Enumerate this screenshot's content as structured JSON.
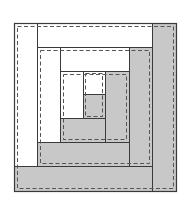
{
  "diagram": {
    "colors": {
      "background": "#ffffff",
      "light_fabric": "#ffffff",
      "dark_fabric": "#c8c8c8",
      "outline": "#3a3a3a",
      "seam": "#555555"
    },
    "block": {
      "x": 14,
      "y": 23,
      "w": 162,
      "h": 168
    },
    "strips": [
      {
        "id": "round1-left",
        "tone": "light",
        "x": 14,
        "y": 23,
        "w": 23,
        "h": 143
      },
      {
        "id": "round1-top",
        "tone": "light",
        "x": 37,
        "y": 23,
        "w": 115,
        "h": 24
      },
      {
        "id": "round1-right",
        "tone": "dark",
        "x": 152,
        "y": 23,
        "w": 24,
        "h": 168
      },
      {
        "id": "round1-bottom",
        "tone": "dark",
        "x": 14,
        "y": 166,
        "w": 138,
        "h": 25
      },
      {
        "id": "round2-left",
        "tone": "light",
        "x": 37,
        "y": 47,
        "w": 23,
        "h": 95
      },
      {
        "id": "round2-top",
        "tone": "light",
        "x": 60,
        "y": 47,
        "w": 69,
        "h": 24
      },
      {
        "id": "round2-right",
        "tone": "dark",
        "x": 129,
        "y": 47,
        "w": 23,
        "h": 119
      },
      {
        "id": "round2-bottom",
        "tone": "dark",
        "x": 37,
        "y": 142,
        "w": 92,
        "h": 24
      },
      {
        "id": "round3-left",
        "tone": "light",
        "x": 60,
        "y": 71,
        "w": 23,
        "h": 47
      },
      {
        "id": "round3-top",
        "tone": "light",
        "x": 83,
        "y": 71,
        "w": 22,
        "h": 23
      },
      {
        "id": "round3-right",
        "tone": "dark",
        "x": 105,
        "y": 71,
        "w": 24,
        "h": 71
      },
      {
        "id": "round3-bottom",
        "tone": "dark",
        "x": 60,
        "y": 118,
        "w": 45,
        "h": 24
      },
      {
        "id": "center",
        "tone": "dark",
        "x": 83,
        "y": 94,
        "w": 22,
        "h": 24
      }
    ],
    "seams": [
      {
        "id": "seam-round1",
        "x": 17,
        "y": 26,
        "w": 156,
        "h": 162
      },
      {
        "id": "seam-round2",
        "x": 40,
        "y": 50,
        "w": 109,
        "h": 113
      },
      {
        "id": "seam-round3",
        "x": 63,
        "y": 74,
        "w": 63,
        "h": 65
      },
      {
        "id": "seam-center",
        "x": 85,
        "y": 73,
        "w": 17,
        "h": 43
      }
    ]
  }
}
